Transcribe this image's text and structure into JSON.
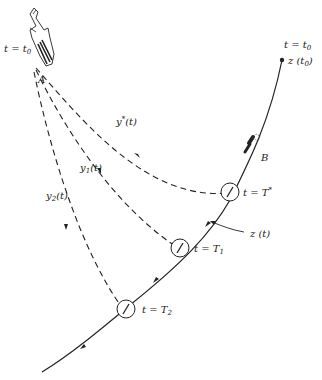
{
  "diagram": {
    "type": "pursuit-interception",
    "labels": {
      "missile_time": "t = t",
      "missile_time_sub": "0",
      "missile_name": "A",
      "target_name": "B",
      "target_start_time": "t = t",
      "target_start_time_sub": "0",
      "target_start_pos": "z (t",
      "target_start_pos_sub": "0",
      "target_start_pos_close": ")",
      "path_optimal": "y",
      "path_optimal_sup": "*",
      "path_optimal_arg": "(t)",
      "path_1": "y",
      "path_1_sub": "1",
      "path_1_arg": "(t)",
      "path_2": "y",
      "path_2_sub": "2",
      "path_2_arg": "(t)",
      "target_path": "z (t)",
      "intercept_optimal": "t = T",
      "intercept_optimal_sup": "*",
      "intercept_1": "t = T",
      "intercept_1_sub": "1",
      "intercept_2": "t = T",
      "intercept_2_sub": "2"
    },
    "colors": {
      "line": "#222222",
      "background": "#ffffff"
    }
  }
}
